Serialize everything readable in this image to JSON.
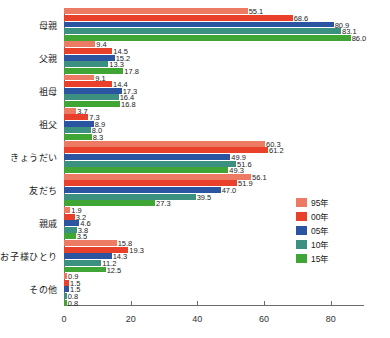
{
  "chart_data": {
    "type": "bar",
    "orientation": "horizontal",
    "title": "",
    "subtitle": "",
    "xlabel": "",
    "ylabel": "",
    "xlim": [
      0,
      90
    ],
    "xticks": [
      0,
      20,
      40,
      60,
      80
    ],
    "xtick_labels": [
      "0",
      "20",
      "40",
      "60",
      "80"
    ],
    "grid": false,
    "legend_position": "right",
    "categories": [
      "母親",
      "父親",
      "祖母",
      "祖父",
      "きょうだい",
      "友だち",
      "親戚",
      "お子様ひとり",
      "その他"
    ],
    "series": [
      {
        "name": "95年",
        "color": "#ED7B63",
        "values": [
          55.1,
          9.4,
          9.1,
          3.7,
          60.3,
          56.1,
          1.9,
          15.8,
          0.9
        ],
        "labels": [
          "55.1",
          "9.4",
          "9.1",
          "3.7",
          "60.3",
          "56.1",
          "1.9",
          "15.8",
          "0.9"
        ]
      },
      {
        "name": "00年",
        "color": "#E8402A",
        "values": [
          68.6,
          14.5,
          14.4,
          7.3,
          61.2,
          51.9,
          3.2,
          19.3,
          1.5
        ],
        "labels": [
          "68.6",
          "14.5",
          "14.4",
          "7.3",
          "61.2",
          "51.9",
          "3.2",
          "19.3",
          "1.5"
        ]
      },
      {
        "name": "05年",
        "color": "#2B55A0",
        "values": [
          80.9,
          15.2,
          17.3,
          8.9,
          49.9,
          47.0,
          4.6,
          14.3,
          1.5
        ],
        "labels": [
          "80.9",
          "15.2",
          "17.3",
          "8.9",
          "49.9",
          "47.0",
          "4.6",
          "14.3",
          "1.5"
        ]
      },
      {
        "name": "10年",
        "color": "#3C9080",
        "values": [
          83.1,
          13.3,
          16.4,
          8.0,
          51.6,
          39.5,
          3.8,
          11.2,
          0.8
        ],
        "labels": [
          "83.1",
          "13.3",
          "16.4",
          "8.0",
          "51.6",
          "39.5",
          "3.8",
          "11.2",
          "0.8"
        ]
      },
      {
        "name": "15年",
        "color": "#3FA535",
        "values": [
          86.0,
          17.8,
          16.8,
          8.3,
          49.3,
          27.3,
          3.5,
          12.5,
          0.8
        ],
        "labels": [
          "86.0",
          "17.8",
          "16.8",
          "8.3",
          "49.3",
          "27.3",
          "3.5",
          "12.5",
          "0.8"
        ]
      }
    ]
  },
  "legend": {
    "items": [
      {
        "label": "95年",
        "color": "#ED7B63"
      },
      {
        "label": "00年",
        "color": "#E8402A"
      },
      {
        "label": "05年",
        "color": "#2B55A0"
      },
      {
        "label": "10年",
        "color": "#3C9080"
      },
      {
        "label": "15年",
        "color": "#3FA535"
      }
    ]
  }
}
